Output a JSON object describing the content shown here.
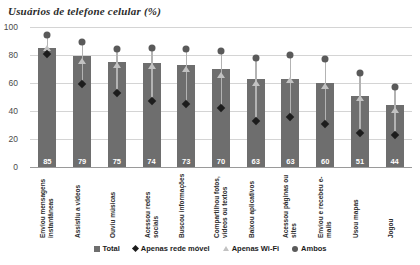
{
  "chart_data": {
    "type": "bar",
    "title": "Usuários de telefone celular (%)",
    "xlabel": "",
    "ylabel": "",
    "ylim": [
      0,
      100
    ],
    "yticks": [
      0,
      20,
      40,
      60,
      80,
      100
    ],
    "grid": true,
    "legend_position": "bottom",
    "categories": [
      "Enviou mensagens instantâneas",
      "Assistiu a vídeos",
      "Ouviu músicas",
      "Acessou redes sociais",
      "Buscou informações",
      "Compartilhou fotos, vídeos ou textos",
      "Baixou aplicativos",
      "Acessou páginas ou sites",
      "Enviou e recebeu e-mails",
      "Usou mapas",
      "Jogou"
    ],
    "series": [
      {
        "name": "Total",
        "marker": "square",
        "color": "#6e6e6e",
        "values": [
          85,
          79,
          75,
          74,
          73,
          70,
          63,
          63,
          60,
          51,
          44
        ]
      },
      {
        "name": "Apenas rede móvel",
        "marker": "diamond",
        "color": "#1c1c1c",
        "values": [
          81,
          59,
          53,
          47,
          45,
          42,
          33,
          36,
          31,
          24,
          23
        ]
      },
      {
        "name": "Apenas Wi-Fi",
        "marker": "triangle",
        "color": "#c2c2c2",
        "values": [
          85,
          76,
          73,
          72,
          70,
          66,
          60,
          62,
          58,
          49,
          41
        ]
      },
      {
        "name": "Ambos",
        "marker": "circle",
        "color": "#5a5a5a",
        "values": [
          94,
          89,
          84,
          85,
          84,
          83,
          78,
          80,
          77,
          67,
          57
        ]
      }
    ],
    "bar_value_labels": [
      "85",
      "79",
      "75",
      "74",
      "73",
      "70",
      "63",
      "63",
      "60",
      "51",
      "44"
    ]
  },
  "legend": {
    "items": [
      {
        "label": "Total"
      },
      {
        "label": "Apenas rede móvel"
      },
      {
        "label": "Apenas Wi-Fi"
      },
      {
        "label": "Ambos"
      }
    ]
  },
  "axis": {
    "y_tick_labels": [
      "100",
      "80",
      "60",
      "40",
      "20",
      "0"
    ]
  }
}
